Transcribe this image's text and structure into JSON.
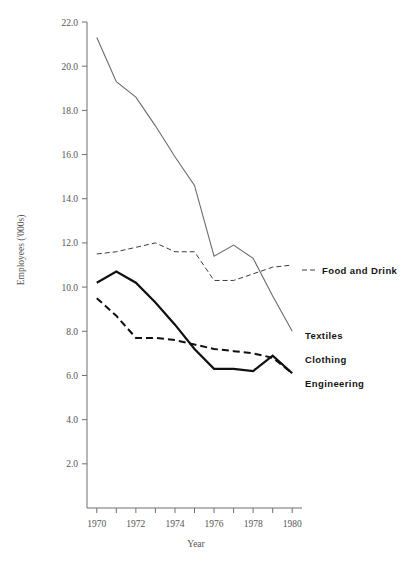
{
  "chart_data": {
    "type": "line",
    "title": "",
    "xlabel": "Year",
    "ylabel": "Employees ('000s)",
    "xlim": [
      1969.5,
      1980.5
    ],
    "ylim": [
      0.0,
      22.0
    ],
    "grid": false,
    "legend_position": "right-inline-labels",
    "x": [
      1970,
      1971,
      1972,
      1973,
      1974,
      1975,
      1976,
      1977,
      1978,
      1979,
      1980
    ],
    "x_tick_values": [
      1970,
      1971,
      1972,
      1973,
      1974,
      1975,
      1976,
      1977,
      1978,
      1979,
      1980
    ],
    "x_tick_labels": [
      "1970",
      "",
      "1972",
      "",
      "1974",
      "",
      "1976",
      "",
      "1978",
      "",
      "1980"
    ],
    "y_ticks": [
      2.0,
      4.0,
      6.0,
      8.0,
      10.0,
      12.0,
      14.0,
      16.0,
      18.0,
      20.0,
      22.0
    ],
    "y_tick_labels": [
      "2.0",
      "4.0",
      "6.0",
      "8.0",
      "10.0",
      "12.0",
      "14.0",
      "16.0",
      "18.0",
      "20.0",
      "22.0"
    ],
    "series": [
      {
        "name": "Textiles",
        "label": "Textiles",
        "style": "solid-thin",
        "color": "#6b6b6b",
        "values": [
          21.3,
          19.3,
          18.6,
          17.3,
          15.9,
          14.6,
          11.4,
          11.9,
          11.3,
          9.6,
          8.0
        ]
      },
      {
        "name": "Food and Drink",
        "label": "Food and Drink",
        "style": "dotted",
        "color": "#3d3d3d",
        "values": [
          11.5,
          11.6,
          11.8,
          12.0,
          11.6,
          11.6,
          10.3,
          10.3,
          10.6,
          10.9,
          11.0
        ]
      },
      {
        "name": "Clothing",
        "label": "Clothing",
        "style": "dashed-thick",
        "color": "#101010",
        "values": [
          9.5,
          8.7,
          7.7,
          7.7,
          7.6,
          7.4,
          7.2,
          7.1,
          7.0,
          6.8,
          6.1
        ]
      },
      {
        "name": "Engineering",
        "label": "Engineering",
        "style": "solid-thick",
        "color": "#101010",
        "values": [
          10.2,
          10.7,
          10.2,
          9.3,
          8.3,
          7.2,
          6.3,
          6.3,
          6.2,
          6.9,
          6.1
        ]
      }
    ],
    "annotations": [
      {
        "text": "Food and Drink",
        "anchor_x": 1980.0,
        "anchor_y": 11.0
      },
      {
        "text": "Textiles",
        "anchor_x": 1980.0,
        "anchor_y": 8.0
      },
      {
        "text": "Clothing",
        "anchor_x": 1980.0,
        "anchor_y": 6.8
      },
      {
        "text": "Engineering",
        "anchor_x": 1980.0,
        "anchor_y": 5.8
      }
    ]
  },
  "axes": {
    "y_title": "Employees ('000s)",
    "x_title": "Year"
  },
  "labels": {
    "food": "Food and Drink",
    "textiles": "Textiles",
    "clothing": "Clothing",
    "engineering": "Engineering"
  }
}
